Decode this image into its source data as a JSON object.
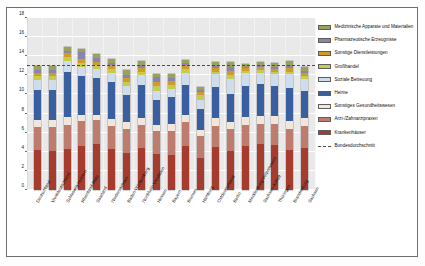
{
  "figure": {
    "title": "Anteil der Gesundheitswirtschaft an den Beschäftigten insgesamt 2013, in v.H."
  },
  "axis": {
    "y_ticks": [
      "0",
      "2",
      "4",
      "6",
      "8",
      "10",
      "12",
      "14",
      "16",
      "18"
    ]
  },
  "legend": {
    "items": [
      {
        "label": "Medizinische Apparate und Materialien",
        "color": "#9aa05e"
      },
      {
        "label": "Pharmazeutische Erzeugnisse",
        "color": "#8a85a8"
      },
      {
        "label": "Sonstige Dienstleistungen",
        "color": "#cf9b2a"
      },
      {
        "label": "Großhandel",
        "color": "#c5cc47"
      },
      {
        "label": "Soziale Betreuung",
        "color": "#cfdcec"
      },
      {
        "label": "Heime",
        "color": "#3a5fa0"
      },
      {
        "label": "Sonstiges Gesundheitswesen",
        "color": "#f2e6dc"
      },
      {
        "label": "Arzt-/Zahnarztpraxen",
        "color": "#bd7c6e"
      },
      {
        "label": "Krankenhäuser",
        "color": "#a53c2e"
      },
      {
        "label": "Bundesdurchschnitt",
        "color": "#4a4a4a",
        "style": "dashed-line"
      }
    ]
  },
  "chart_data": {
    "type": "bar",
    "stacked": true,
    "title": "Anteil der Gesundheitswirtschaft an den Beschäftigten insgesamt 2013, in v.H.",
    "xlabel": "",
    "ylabel": "",
    "ylim": [
      0,
      18
    ],
    "ytick_step": 2,
    "grid": true,
    "legend_position": "right",
    "annotations": [
      {
        "type": "hline",
        "label": "Bundesdurchschnitt",
        "value": 13.0,
        "style": "dashed"
      }
    ],
    "categories": [
      "Deutschland",
      "Westdeutschland",
      "Schleswig-Holstein",
      "Rheinland-Pfalz",
      "Saarland",
      "Niedersachsen",
      "Baden-Württemberg",
      "Nordrhein-Westfalen",
      "Hessen",
      "Bayern",
      "Bremen",
      "Hamburg",
      "Ostdeutschland",
      "Berlin",
      "Mecklenburg-Vorpommern",
      "Sachsen-Anhalt",
      "Thüringen",
      "Brandenburg",
      "Sachsen"
    ],
    "series": [
      {
        "name": "Krankenhäuser",
        "color": "#a53c2e",
        "values": [
          4.2,
          4.1,
          4.3,
          4.6,
          4.8,
          4.3,
          3.9,
          4.4,
          3.8,
          3.7,
          4.6,
          3.4,
          4.5,
          4.1,
          4.6,
          4.8,
          4.7,
          4.2,
          4.4
        ]
      },
      {
        "name": "Arzt-/Zahnarztpraxen",
        "color": "#bd7c6e",
        "values": [
          2.4,
          2.5,
          2.5,
          2.6,
          2.5,
          2.4,
          2.5,
          2.4,
          2.4,
          2.5,
          2.5,
          2.3,
          2.2,
          2.3,
          2.2,
          2.1,
          2.2,
          2.2,
          2.3
        ]
      },
      {
        "name": "Sonstiges Gesundheitswesen",
        "color": "#f2e6dc",
        "values": [
          0.7,
          0.7,
          0.8,
          0.7,
          0.6,
          0.7,
          0.7,
          0.7,
          0.6,
          0.7,
          0.7,
          0.6,
          0.8,
          0.7,
          0.8,
          0.8,
          0.8,
          0.8,
          0.8
        ]
      },
      {
        "name": "Heime",
        "color": "#3a5fa0",
        "values": [
          3.2,
          3.2,
          4.8,
          4.0,
          3.8,
          3.9,
          2.8,
          3.5,
          2.6,
          2.8,
          3.2,
          2.2,
          3.3,
          2.9,
          3.3,
          3.4,
          3.2,
          3.5,
          2.9
        ]
      },
      {
        "name": "Soziale Betreuung",
        "color": "#cfdcec",
        "values": [
          1.0,
          1.0,
          1.1,
          1.0,
          1.0,
          1.0,
          1.0,
          1.0,
          1.0,
          0.9,
          1.3,
          0.9,
          1.3,
          1.6,
          1.3,
          1.2,
          1.2,
          1.4,
          1.2
        ]
      },
      {
        "name": "Großhandel",
        "color": "#c5cc47",
        "values": [
          0.4,
          0.4,
          0.4,
          0.4,
          0.4,
          0.4,
          0.4,
          0.4,
          0.5,
          0.4,
          0.4,
          0.5,
          0.3,
          0.4,
          0.3,
          0.3,
          0.3,
          0.3,
          0.3
        ]
      },
      {
        "name": "Sonstige Dienstleistungen",
        "color": "#cf9b2a",
        "values": [
          0.4,
          0.4,
          0.4,
          0.4,
          0.3,
          0.4,
          0.4,
          0.4,
          0.4,
          0.4,
          0.4,
          0.4,
          0.4,
          0.5,
          0.3,
          0.3,
          0.3,
          0.4,
          0.4
        ]
      },
      {
        "name": "Pharmazeutische Erzeugnisse",
        "color": "#8a85a8",
        "values": [
          0.3,
          0.3,
          0.3,
          0.7,
          0.4,
          0.2,
          0.3,
          0.3,
          0.5,
          0.3,
          0.2,
          0.2,
          0.2,
          0.4,
          0.1,
          0.2,
          0.2,
          0.3,
          0.2
        ]
      },
      {
        "name": "Medizinische Apparate und Materialien",
        "color": "#9aa05e",
        "values": [
          0.4,
          0.4,
          0.4,
          0.4,
          0.4,
          0.4,
          0.6,
          0.4,
          0.4,
          0.4,
          0.3,
          0.3,
          0.4,
          0.5,
          0.3,
          0.3,
          0.4,
          0.4,
          0.4
        ]
      }
    ],
    "totals": [
      13.0,
      13.0,
      15.0,
      14.8,
      14.2,
      13.7,
      12.6,
      13.5,
      12.2,
      12.1,
      13.6,
      10.8,
      13.4,
      13.4,
      13.2,
      13.4,
      13.3,
      13.5,
      12.9
    ]
  }
}
